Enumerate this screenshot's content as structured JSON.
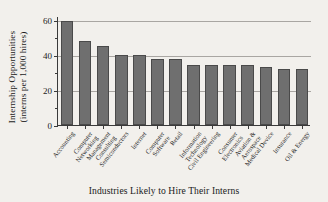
{
  "chart_data": {
    "type": "bar",
    "title": "",
    "xlabel": "Industries Likely to Hire Their Interns",
    "ylabel_line1": "Internship Opportunities",
    "ylabel_line2": "(interns per 1,000 hires)",
    "ylim": [
      0,
      62
    ],
    "yticks_major": [
      0,
      20,
      40,
      60
    ],
    "yticks_minor": [
      10,
      30,
      50
    ],
    "gridlines": [
      20,
      40,
      60
    ],
    "grid": true,
    "legend": null,
    "bar_color": "#6f6f6f",
    "bar_edge_color": "#4a4a4a",
    "background_color": "#f2f0ec",
    "axis_color": "#3a3a3a",
    "grid_color": "#a9a6a2",
    "categories": [
      "Accounting",
      "Computer Networking",
      "Management Consulting",
      "Semiconductors",
      "Internet",
      "Computer Software",
      "Retail",
      "Information Technology",
      "Civil Engineering",
      "Consumer Electronics",
      "Aviation & Aerospace",
      "Medical Device",
      "Insurance",
      "Oil & Energy"
    ],
    "category_lines": [
      [
        "Accounting"
      ],
      [
        "Computer",
        "Networking"
      ],
      [
        "Management",
        "Consulting"
      ],
      [
        "Semiconductors"
      ],
      [
        "Internet"
      ],
      [
        "Computer",
        "Software"
      ],
      [
        "Retail"
      ],
      [
        "Information",
        "Technology"
      ],
      [
        "Civil Engineering"
      ],
      [
        "Consumer",
        "Electronics"
      ],
      [
        "Aviation &",
        "Aerospace"
      ],
      [
        "Medical Device"
      ],
      [
        "Insurance"
      ],
      [
        "Oil & Energy"
      ]
    ],
    "values": [
      59,
      48,
      45,
      40,
      40,
      37.5,
      37.5,
      34,
      34,
      34,
      34,
      33,
      32,
      32
    ]
  }
}
